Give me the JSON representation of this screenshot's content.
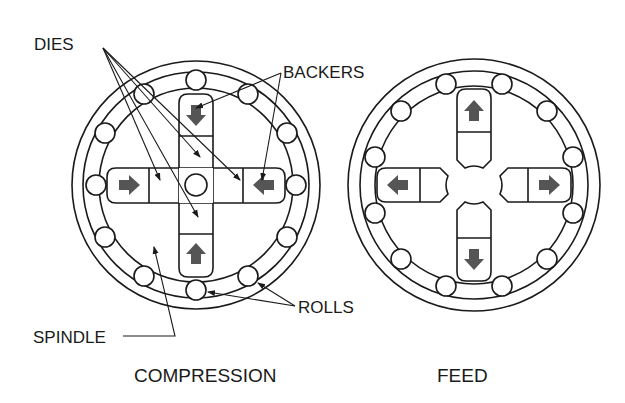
{
  "figure": {
    "panels": [
      {
        "id": "compression",
        "caption": "COMPRESSION",
        "die_motion": "inward"
      },
      {
        "id": "feed",
        "caption": "FEED",
        "die_motion": "outward"
      }
    ],
    "labels": {
      "dies": "DIES",
      "backers": "BACKERS",
      "rolls": "ROLLS",
      "spindle": "SPINDLE"
    },
    "colors": {
      "line": "#1a1a1a",
      "arrow": "#555555",
      "background": "#ffffff"
    }
  }
}
